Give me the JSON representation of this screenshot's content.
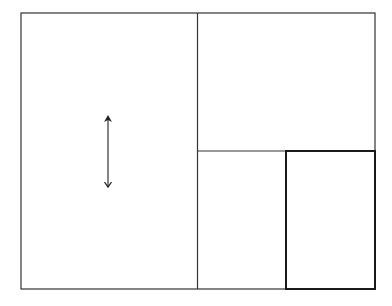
{
  "diagram": {
    "width": 392,
    "height": 306,
    "stroke_color": "#333333",
    "bold_stroke_color": "#1a1a1a",
    "outer_rect": {
      "x": 21,
      "y": 13,
      "w": 354,
      "h": 276
    },
    "vertical_divider": {
      "x": 197.5,
      "y1": 13,
      "y2": 289
    },
    "horizontal_divider": {
      "x1": 197.5,
      "x2": 375,
      "y": 151
    },
    "highlighted_rect": {
      "x": 286,
      "y": 151,
      "w": 89,
      "h": 138
    },
    "arrow": {
      "x": 108,
      "y1": 115,
      "y2": 187,
      "direction": "vertical-double"
    }
  }
}
